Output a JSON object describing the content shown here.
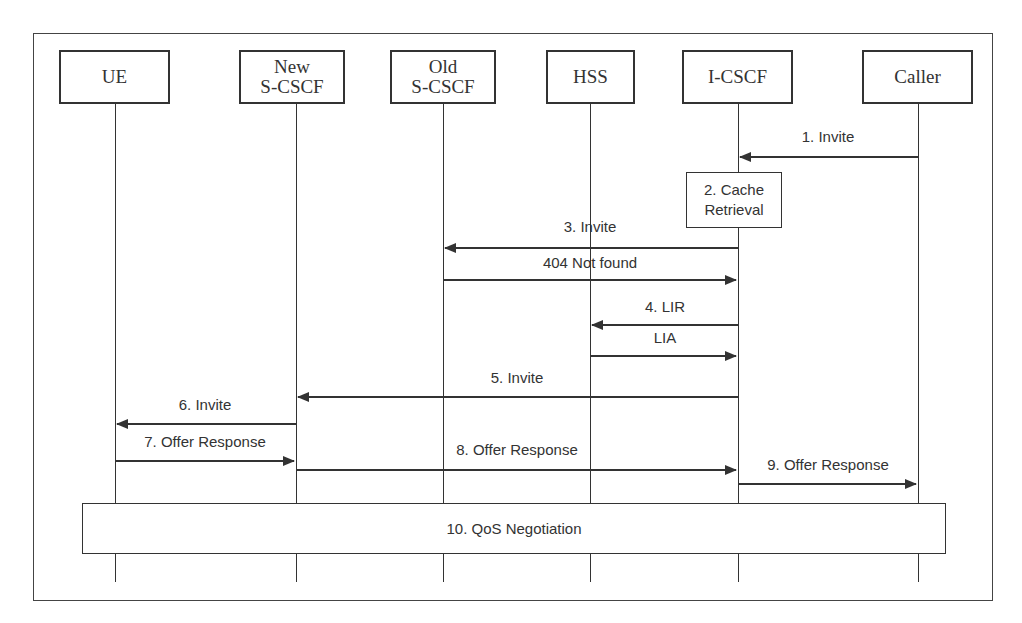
{
  "diagram": {
    "type": "sequence",
    "actors": [
      {
        "id": "ue",
        "label": "UE"
      },
      {
        "id": "new-scscf",
        "label": "New\nS-CSCF"
      },
      {
        "id": "old-scscf",
        "label": "Old\nS-CSCF"
      },
      {
        "id": "hss",
        "label": "HSS"
      },
      {
        "id": "icscf",
        "label": "I-CSCF"
      },
      {
        "id": "caller",
        "label": "Caller"
      }
    ],
    "messages": [
      {
        "label": "1. Invite",
        "from": "caller",
        "to": "icscf"
      },
      {
        "label": "3. Invite",
        "from": "icscf",
        "to": "old-scscf"
      },
      {
        "label": "404 Not found",
        "from": "old-scscf",
        "to": "icscf"
      },
      {
        "label": "4. LIR",
        "from": "icscf",
        "to": "hss"
      },
      {
        "label": "LIA",
        "from": "hss",
        "to": "icscf"
      },
      {
        "label": "5. Invite",
        "from": "icscf",
        "to": "new-scscf"
      },
      {
        "label": "6. Invite",
        "from": "new-scscf",
        "to": "ue"
      },
      {
        "label": "7. Offer Response",
        "from": "ue",
        "to": "new-scscf"
      },
      {
        "label": "8. Offer Response",
        "from": "new-scscf",
        "to": "icscf"
      },
      {
        "label": "9. Offer Response",
        "from": "icscf",
        "to": "caller"
      }
    ],
    "notes": [
      {
        "label": "2. Cache\nRetrieval",
        "on": "icscf"
      },
      {
        "label": "10. QoS Negotiation",
        "spans": [
          "ue",
          "caller"
        ]
      }
    ]
  }
}
